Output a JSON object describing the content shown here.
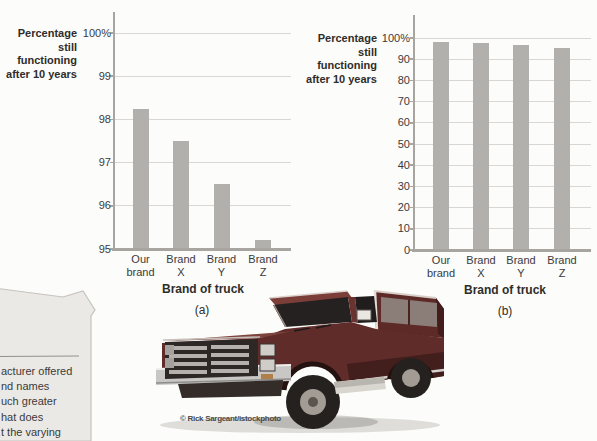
{
  "figure": {
    "background": "#fcfcfa",
    "bar_color": "#b2b0ad",
    "grid_color": "#d9d7d3",
    "axis_color": "#a8a5a1",
    "text_color": "#333333"
  },
  "chart_data": [
    {
      "type": "bar",
      "panel": "(a)",
      "title": "Percentage still functioning after 10 years",
      "title_lines": [
        "Percentage",
        "still functioning",
        "after 10 years"
      ],
      "xlabel": "Brand of truck",
      "ylabel": "Percentage still functioning after 10 years",
      "categories": [
        "Our brand",
        "Brand X",
        "Brand Y",
        "Brand Z"
      ],
      "category_lines": [
        [
          "Our",
          "brand"
        ],
        [
          "Brand",
          "X"
        ],
        [
          "Brand",
          "Y"
        ],
        [
          "Brand",
          "Z"
        ]
      ],
      "values": [
        98.25,
        97.5,
        96.5,
        95.2
      ],
      "ylim": [
        95,
        100
      ],
      "yticks": [
        100,
        99,
        98,
        97,
        96,
        95
      ],
      "ytick_labels": [
        "100%",
        "99",
        "98",
        "97",
        "96",
        "95"
      ],
      "grid": true,
      "legend": null
    },
    {
      "type": "bar",
      "panel": "(b)",
      "title": "Percentage still functioning after 10 years",
      "title_lines": [
        "Percentage",
        "still functioning",
        "after 10 years"
      ],
      "xlabel": "Brand of truck",
      "ylabel": "Percentage still functioning after 10 years",
      "categories": [
        "Our brand",
        "Brand X",
        "Brand Y",
        "Brand Z"
      ],
      "category_lines": [
        [
          "Our",
          "brand"
        ],
        [
          "Brand",
          "X"
        ],
        [
          "Brand",
          "Y"
        ],
        [
          "Brand",
          "Z"
        ]
      ],
      "values": [
        98.25,
        97.5,
        96.5,
        95.2
      ],
      "ylim": [
        0,
        100
      ],
      "yticks": [
        100,
        90,
        80,
        70,
        60,
        50,
        40,
        30,
        20,
        10,
        0
      ],
      "ytick_labels": [
        "100%",
        "90",
        "80",
        "70",
        "60",
        "50",
        "40",
        "30",
        "20",
        "10",
        "0"
      ],
      "grid": true,
      "legend": null
    }
  ],
  "photo": {
    "credit": "© Rick Sargeant/istockphoto",
    "subject": "dark red pickup truck with camper shell"
  },
  "callout": {
    "visible_lines": [
      "acturer offered",
      "nd names",
      "uch greater",
      "hat does",
      "t the varying"
    ]
  }
}
